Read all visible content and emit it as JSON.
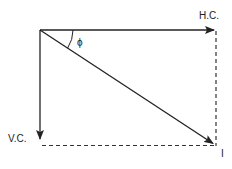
{
  "diagram": {
    "title": "",
    "labels": {
      "horizontal_component": "H.C.",
      "vertical_component": "V.C.",
      "resultant": "I",
      "angle": "ϕ"
    },
    "colors": {
      "line": "#222222",
      "background": "#ffffff"
    },
    "vectors": [
      {
        "name": "H.C.",
        "from": [
          40,
          30
        ],
        "to": [
          215,
          30
        ],
        "style": "solid-arrow"
      },
      {
        "name": "V.C.",
        "from": [
          40,
          30
        ],
        "to": [
          40,
          139
        ],
        "style": "solid-arrow"
      },
      {
        "name": "I",
        "from": [
          40,
          30
        ],
        "to": [
          214,
          144
        ],
        "style": "solid-arrow"
      }
    ],
    "dashed_lines": [
      {
        "from": [
          216,
          30
        ],
        "to": [
          216,
          146
        ]
      },
      {
        "from": [
          40,
          145
        ],
        "to": [
          216,
          145
        ]
      }
    ]
  }
}
